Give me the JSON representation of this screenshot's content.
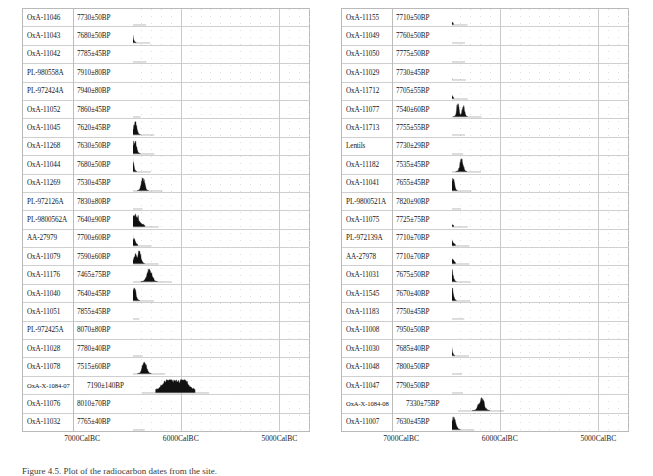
{
  "caption": {
    "text": "Figure 4.5. Plot of the radiocarbon dates from the site."
  },
  "chart_data": {
    "type": "line",
    "title": "",
    "xlabel": "",
    "ylabel": "",
    "xlim": [
      7600,
      4700
    ],
    "x_axis_direction": "decreasing",
    "grid": true,
    "legend": "none",
    "x_ticks": [
      7000,
      6000,
      5000
    ],
    "x_tick_labels": [
      "7000CalBC",
      "6000CalBC",
      "5000CalBC"
    ],
    "panels": [
      {
        "name": "left",
        "column_headers": [
          "lab_code",
          "radiocarbon_date"
        ],
        "rows": [
          {
            "lab_code": "OxA-11046",
            "date": "7730±50BP",
            "bp": 7730,
            "err": 50,
            "center": 6570,
            "width": 150,
            "shape": "plateau"
          },
          {
            "lab_code": "OxA-11043",
            "date": "7680±50BP",
            "bp": 7680,
            "err": 50,
            "center": 6520,
            "width": 135,
            "shape": "peak-right"
          },
          {
            "lab_code": "OxA-11042",
            "date": "7785±45BP",
            "bp": 7785,
            "err": 45,
            "center": 6555,
            "width": 130,
            "shape": "peak-left"
          },
          {
            "lab_code": "PL-980558A",
            "date": "7910±80BP",
            "bp": 7910,
            "err": 80,
            "center": 6805,
            "width": 330,
            "shape": "broad-plateau"
          },
          {
            "lab_code": "PL-972424A",
            "date": "7940±80BP",
            "bp": 7940,
            "err": 80,
            "center": 6820,
            "width": 330,
            "shape": "broad-plateau"
          },
          {
            "lab_code": "OxA-11052",
            "date": "7860±45BP",
            "bp": 7860,
            "err": 45,
            "center": 6665,
            "width": 230,
            "shape": "tail-left"
          },
          {
            "lab_code": "OxA-11045",
            "date": "7620±45BP",
            "bp": 7620,
            "err": 45,
            "center": 6465,
            "width": 110,
            "shape": "narrow-peak"
          },
          {
            "lab_code": "OxA-11268",
            "date": "7630±50BP",
            "bp": 7630,
            "err": 50,
            "center": 6470,
            "width": 120,
            "shape": "narrow-peak"
          },
          {
            "lab_code": "OxA-11044",
            "date": "7680±50BP",
            "bp": 7680,
            "err": 50,
            "center": 6510,
            "width": 130,
            "shape": "peak-right"
          },
          {
            "lab_code": "OxA-11269",
            "date": "7530±45BP",
            "bp": 7530,
            "err": 45,
            "center": 6385,
            "width": 115,
            "shape": "narrow-peak"
          },
          {
            "lab_code": "PL-972126A",
            "date": "7830±80BP",
            "bp": 7830,
            "err": 80,
            "center": 6670,
            "width": 280,
            "shape": "tail-left"
          },
          {
            "lab_code": "PL-9800562A",
            "date": "7640±90BP",
            "bp": 7640,
            "err": 90,
            "center": 6490,
            "width": 250,
            "shape": "plateau"
          },
          {
            "lab_code": "AA-27979",
            "date": "7700±60BP",
            "bp": 7700,
            "err": 60,
            "center": 6525,
            "width": 175,
            "shape": "plateau"
          },
          {
            "lab_code": "OxA-11079",
            "date": "7590±60BP",
            "bp": 7590,
            "err": 60,
            "center": 6440,
            "width": 145,
            "shape": "peak-right"
          },
          {
            "lab_code": "OxA-11176",
            "date": "7465±75BP",
            "bp": 7465,
            "err": 75,
            "center": 6320,
            "width": 170,
            "shape": "narrow-peak"
          },
          {
            "lab_code": "OxA-11040",
            "date": "7640±45BP",
            "bp": 7640,
            "err": 45,
            "center": 6475,
            "width": 120,
            "shape": "narrow-peak"
          },
          {
            "lab_code": "OxA-11051",
            "date": "7855±45BP",
            "bp": 7855,
            "err": 45,
            "center": 6670,
            "width": 215,
            "shape": "tail-left"
          },
          {
            "lab_code": "PL-972425A",
            "date": "8070±80BP",
            "bp": 8070,
            "err": 80,
            "center": 7010,
            "width": 360,
            "shape": "broad-rough"
          },
          {
            "lab_code": "OxA-11028",
            "date": "7780±40BP",
            "bp": 7780,
            "err": 40,
            "center": 6590,
            "width": 120,
            "shape": "peak-left"
          },
          {
            "lab_code": "OxA-11078",
            "date": "7515±60BP",
            "bp": 7515,
            "err": 60,
            "center": 6370,
            "width": 140,
            "shape": "narrow-peak"
          },
          {
            "lab_code": "OxA-X-1084-07",
            "date": "7190±140BP",
            "bp": 7190,
            "err": 140,
            "center": 6055,
            "width": 400,
            "shape": "broad-plateau"
          },
          {
            "lab_code": "OxA-11076",
            "date": "8010±70BP",
            "bp": 8010,
            "err": 70,
            "center": 6925,
            "width": 300,
            "shape": "broad-rough"
          },
          {
            "lab_code": "OxA-11032",
            "date": "7765±40BP",
            "bp": 7765,
            "err": 40,
            "center": 6570,
            "width": 125,
            "shape": "plateau"
          }
        ]
      },
      {
        "name": "right",
        "column_headers": [
          "lab_code",
          "radiocarbon_date"
        ],
        "rows": [
          {
            "lab_code": "OxA-11155",
            "date": "7710±50BP",
            "bp": 7710,
            "err": 50,
            "center": 6540,
            "width": 140,
            "shape": "plateau"
          },
          {
            "lab_code": "OxA-11049",
            "date": "7760±50BP",
            "bp": 7760,
            "err": 50,
            "center": 6570,
            "width": 150,
            "shape": "peak-right"
          },
          {
            "lab_code": "OxA-11050",
            "date": "7775±50BP",
            "bp": 7775,
            "err": 50,
            "center": 6580,
            "width": 170,
            "shape": "tail-left"
          },
          {
            "lab_code": "OxA-11029",
            "date": "7730±45BP",
            "bp": 7730,
            "err": 45,
            "center": 6555,
            "width": 140,
            "shape": "plateau"
          },
          {
            "lab_code": "OxA-11712",
            "date": "7705±55BP",
            "bp": 7705,
            "err": 55,
            "center": 6540,
            "width": 145,
            "shape": "plateau"
          },
          {
            "lab_code": "OxA-11077",
            "date": "7540±60BP",
            "bp": 7540,
            "err": 60,
            "center": 6400,
            "width": 145,
            "shape": "double-peak"
          },
          {
            "lab_code": "OxA-11713",
            "date": "7755±55BP",
            "bp": 7755,
            "err": 55,
            "center": 6570,
            "width": 150,
            "shape": "peak-left"
          },
          {
            "lab_code": "Lentils",
            "date": "7730±29BP",
            "bp": 7730,
            "err": 29,
            "center": 6560,
            "width": 95,
            "shape": "narrow-peak"
          },
          {
            "lab_code": "OxA-11182",
            "date": "7535±45BP",
            "bp": 7535,
            "err": 45,
            "center": 6390,
            "width": 115,
            "shape": "narrow-peak"
          },
          {
            "lab_code": "OxA-11041",
            "date": "7655±45BP",
            "bp": 7655,
            "err": 45,
            "center": 6490,
            "width": 120,
            "shape": "peak-right"
          },
          {
            "lab_code": "PL-9800521A",
            "date": "7820±90BP",
            "bp": 7820,
            "err": 90,
            "center": 6700,
            "width": 330,
            "shape": "broad-rough"
          },
          {
            "lab_code": "OxA-11075",
            "date": "7725±75BP",
            "bp": 7725,
            "err": 75,
            "center": 6560,
            "width": 185,
            "shape": "plateau"
          },
          {
            "lab_code": "PL-972139A",
            "date": "7710±70BP",
            "bp": 7710,
            "err": 70,
            "center": 6540,
            "width": 180,
            "shape": "plateau"
          },
          {
            "lab_code": "AA-27978",
            "date": "7710±70BP",
            "bp": 7710,
            "err": 70,
            "center": 6540,
            "width": 180,
            "shape": "plateau"
          },
          {
            "lab_code": "OxA-11031",
            "date": "7675±50BP",
            "bp": 7675,
            "err": 50,
            "center": 6510,
            "width": 140,
            "shape": "peak-right"
          },
          {
            "lab_code": "OxA-11545",
            "date": "7670±40BP",
            "bp": 7670,
            "err": 40,
            "center": 6500,
            "width": 120,
            "shape": "peak-right"
          },
          {
            "lab_code": "OxA-11183",
            "date": "7750±45BP",
            "bp": 7750,
            "err": 45,
            "center": 6570,
            "width": 135,
            "shape": "plateau"
          },
          {
            "lab_code": "OxA-11008",
            "date": "7950±50BP",
            "bp": 7950,
            "err": 50,
            "center": 6840,
            "width": 300,
            "shape": "broad-plateau"
          },
          {
            "lab_code": "OxA-11030",
            "date": "7685±40BP",
            "bp": 7685,
            "err": 40,
            "center": 6515,
            "width": 120,
            "shape": "peak-right"
          },
          {
            "lab_code": "OxA-11048",
            "date": "7800±50BP",
            "bp": 7800,
            "err": 50,
            "center": 6620,
            "width": 190,
            "shape": "plateau"
          },
          {
            "lab_code": "OxA-11047",
            "date": "7790±50BP",
            "bp": 7790,
            "err": 50,
            "center": 6610,
            "width": 190,
            "shape": "plateau"
          },
          {
            "lab_code": "OxA-X-1084-08",
            "date": "7330±75BP",
            "bp": 7330,
            "err": 75,
            "center": 6190,
            "width": 180,
            "shape": "narrow-peak"
          },
          {
            "lab_code": "OxA-11007",
            "date": "7630±45BP",
            "bp": 7630,
            "err": 45,
            "center": 6470,
            "width": 140,
            "shape": "narrow-peak"
          }
        ]
      }
    ]
  },
  "style": {
    "dist_fill": "#111111",
    "grid_color": "#c9c9c9",
    "row_line_color": "#cfcfcf",
    "frame_color": "#b9b9b9",
    "baseline_color": "#9a9a9a",
    "label_col_width_px": 52,
    "label_col_width_px_wide": 62
  }
}
